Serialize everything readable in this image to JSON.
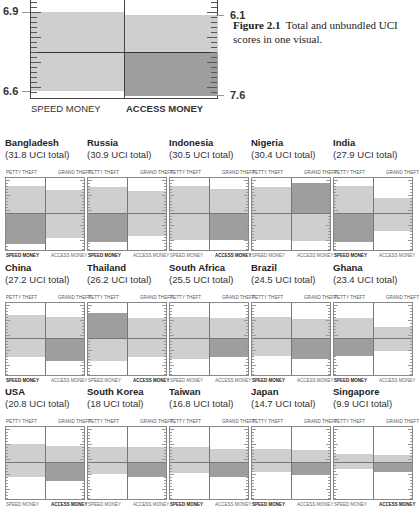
{
  "figure": {
    "caption_label": "Figure 2.1",
    "caption_text": "Total and unbundled UCI scores in one visual."
  },
  "legend_chart": {
    "left_top_value": "6.9",
    "left_bottom_value": "6.6",
    "right_top_value": "6.1",
    "right_bottom_value": "7.6",
    "bottom_left_label": "SPEED MONEY",
    "bottom_right_label": "ACCESS MONEY"
  },
  "panel_labels": {
    "petty": "PETTY THEFT",
    "grand": "GRAND THEFT",
    "speed": "SPEED MONEY",
    "access": "ACCESS MONEY"
  },
  "colors": {
    "light_block": "#cfcfcf",
    "dark_block": "#9e9e9e",
    "line": "#444444"
  },
  "chart_data": {
    "type": "table",
    "title": "Total and unbundled UCI scores in one visual",
    "legend_example": {
      "petty_theft": 6.9,
      "speed_money": 6.6,
      "grand_theft": 6.1,
      "access_money": 7.6
    },
    "countries": [
      {
        "name": "Bangladesh",
        "total": 31.8,
        "total_label": "(31.8 UCI total)",
        "dark": "speed",
        "bold": "speed"
      },
      {
        "name": "Russia",
        "total": 30.9,
        "total_label": "(30.9 UCI total)",
        "dark": "speed",
        "bold": "speed"
      },
      {
        "name": "Indonesia",
        "total": 30.5,
        "total_label": "(30.5 UCI total)",
        "dark": "access",
        "bold": "access"
      },
      {
        "name": "Nigeria",
        "total": 30.4,
        "total_label": "(30.4 UCI total)",
        "dark": "grand",
        "bold": "none"
      },
      {
        "name": "India",
        "total": 27.9,
        "total_label": "(27.9 UCI total)",
        "dark": "speed",
        "bold": "speed"
      },
      {
        "name": "China",
        "total": 27.2,
        "total_label": "(27.2 UCI total)",
        "dark": "access",
        "bold": "speed"
      },
      {
        "name": "Thailand",
        "total": 26.2,
        "total_label": "(26.2 UCI total)",
        "dark": "petty",
        "bold": "access"
      },
      {
        "name": "South Africa",
        "total": 25.5,
        "total_label": "(25.5 UCI total)",
        "dark": "access",
        "bold": "none"
      },
      {
        "name": "Brazil",
        "total": 24.5,
        "total_label": "(24.5 UCI total)",
        "dark": "access",
        "bold": "speed"
      },
      {
        "name": "Ghana",
        "total": 23.4,
        "total_label": "(23.4 UCI total)",
        "dark": "speed",
        "bold": "speed"
      },
      {
        "name": "USA",
        "total": 20.8,
        "total_label": "(20.8 UCI total)",
        "dark": "access",
        "bold": "access"
      },
      {
        "name": "South Korea",
        "total": 18,
        "total_label": "(18 UCI total)",
        "dark": "access",
        "bold": "none"
      },
      {
        "name": "Taiwan",
        "total": 16.8,
        "total_label": "(16.8 UCI total)",
        "dark": "access",
        "bold": "speed"
      },
      {
        "name": "Japan",
        "total": 14.7,
        "total_label": "(14.7 UCI total)",
        "dark": "access",
        "bold": "speed"
      },
      {
        "name": "Singapore",
        "total": 9.9,
        "total_label": "(9.9 UCI total)",
        "dark": "access",
        "bold": "access"
      }
    ]
  },
  "panels": [
    {
      "name": "Bangladesh",
      "total": "(31.8 UCI total)",
      "lt": 8,
      "lb": 66,
      "rt": 12,
      "rb": 60,
      "dark": "lb",
      "bold": "speed"
    },
    {
      "name": "Russia",
      "total": "(30.9 UCI total)",
      "lt": 9,
      "lb": 64,
      "rt": 13,
      "rb": 58,
      "dark": "lb",
      "bold": "speed"
    },
    {
      "name": "Indonesia",
      "total": "(30.5 UCI total)",
      "lt": 8,
      "lb": 62,
      "rt": 11,
      "rb": 62,
      "dark": "rb",
      "bold": "access"
    },
    {
      "name": "Nigeria",
      "total": "(30.4 UCI total)",
      "lt": 9,
      "lb": 62,
      "rt": 5,
      "rb": 63,
      "dark": "rt",
      "bold": "none"
    },
    {
      "name": "India",
      "total": "(27.9 UCI total)",
      "lt": 8,
      "lb": 64,
      "rt": 20,
      "rb": 53,
      "dark": "lb",
      "bold": "speed"
    },
    {
      "name": "China",
      "total": "(27.2 UCI total)",
      "lt": 12,
      "lb": 54,
      "rt": 14,
      "rb": 58,
      "dark": "rb",
      "bold": "speed"
    },
    {
      "name": "Thailand",
      "total": "(26.2 UCI total)",
      "lt": 10,
      "lb": 58,
      "rt": 15,
      "rb": 54,
      "dark": "lt",
      "bold": "access"
    },
    {
      "name": "South Africa",
      "total": "(25.5 UCI total)",
      "lt": 14,
      "lb": 56,
      "rt": 15,
      "rb": 54,
      "dark": "rb",
      "bold": "none"
    },
    {
      "name": "Brazil",
      "total": "(24.5 UCI total)",
      "lt": 14,
      "lb": 53,
      "rt": 16,
      "rb": 56,
      "dark": "rb",
      "bold": "speed"
    },
    {
      "name": "Ghana",
      "total": "(23.4 UCI total)",
      "lt": 15,
      "lb": 53,
      "rt": 24,
      "rb": 48,
      "dark": "lb",
      "bold": "speed"
    },
    {
      "name": "USA",
      "total": "(20.8 UCI total)",
      "lt": 17,
      "lb": 50,
      "rt": 19,
      "rb": 54,
      "dark": "rb",
      "bold": "access"
    },
    {
      "name": "South Korea",
      "total": "(18 UCI total)",
      "lt": 20,
      "lb": 47,
      "rt": 20,
      "rb": 50,
      "dark": "rb",
      "bold": "none"
    },
    {
      "name": "Taiwan",
      "total": "(16.8 UCI total)",
      "lt": 20,
      "lb": 46,
      "rt": 22,
      "rb": 50,
      "dark": "rb",
      "bold": "speed"
    },
    {
      "name": "Japan",
      "total": "(14.7 UCI total)",
      "lt": 22,
      "lb": 45,
      "rt": 23,
      "rb": 48,
      "dark": "rb",
      "bold": "speed"
    },
    {
      "name": "Singapore",
      "total": "(9.9 UCI total)",
      "lt": 27,
      "lb": 42,
      "rt": 28,
      "rb": 45,
      "dark": "rb",
      "bold": "access"
    }
  ]
}
